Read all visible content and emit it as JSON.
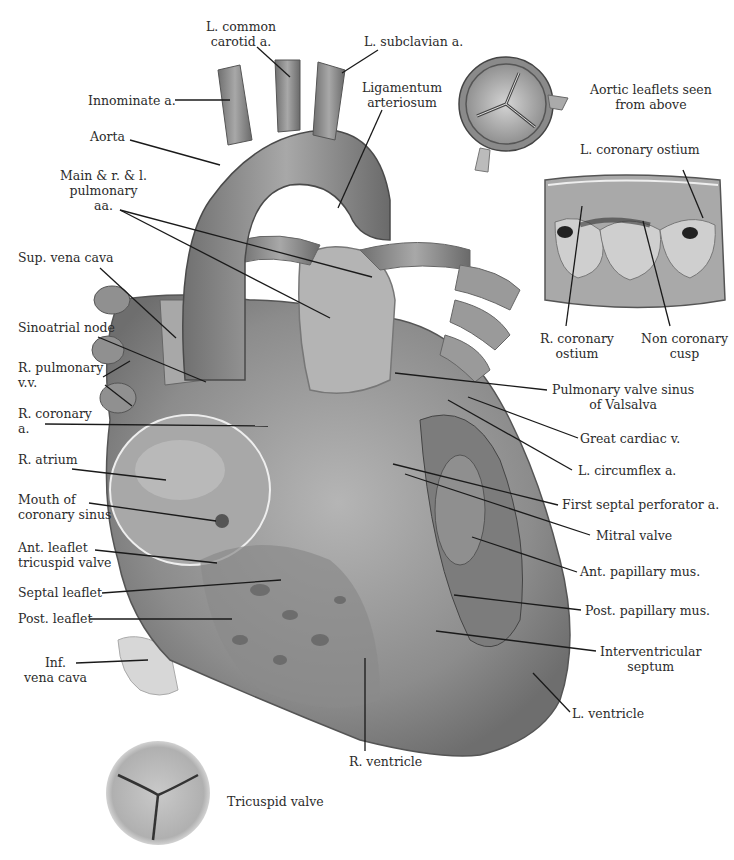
{
  "figure": {
    "insets": {
      "aortic_leaflets": {
        "caption_line1": "Aortic leaflets seen",
        "caption_line2": "from above"
      },
      "aortic_root": {
        "l_coronary_ostium": "L. coronary ostium",
        "r_coronary_ostium_line1": "R. coronary",
        "r_coronary_ostium_line2": "ostium",
        "non_coronary_cusp_line1": "Non coronary",
        "non_coronary_cusp_line2": "cusp"
      },
      "tricuspid": {
        "caption": "Tricuspid valve"
      }
    },
    "labels": {
      "l_common_carotid_1": "L. common",
      "l_common_carotid_2": "carotid a.",
      "l_subclavian": "L. subclavian a.",
      "innominate": "Innominate a.",
      "ligamentum_1": "Ligamentum",
      "ligamentum_2": "arteriosum",
      "aorta": "Aorta",
      "pulm_1": "Main & r. & l.",
      "pulm_2": "pulmonary",
      "pulm_3": "aa.",
      "svc": "Sup. vena cava",
      "sa_node": "Sinoatrial node",
      "r_pulm_vv_1": "R. pulmonary",
      "r_pulm_vv_2": "v.v.",
      "r_coronary_1": "R. coronary",
      "r_coronary_2": "a.",
      "r_atrium": "R. atrium",
      "cor_sinus_1": "Mouth of",
      "cor_sinus_2": "coronary sinus",
      "ant_leaflet_1": "Ant. leaflet",
      "ant_leaflet_2": "tricuspid valve",
      "septal_leaflet": "Septal leaflet",
      "post_leaflet": "Post. leaflet",
      "ivc_1": "Inf.",
      "ivc_2": "vena cava",
      "pulm_sinus_1": "Pulmonary valve sinus",
      "pulm_sinus_2": "of Valsalva",
      "great_cardiac": "Great cardiac v.",
      "l_circumflex": "L. circumflex a.",
      "first_septal": "First septal perforator a.",
      "mitral": "Mitral valve",
      "ant_papillary": "Ant. papillary mus.",
      "post_papillary": "Post. papillary mus.",
      "iv_septum_1": "Interventricular",
      "iv_septum_2": "septum",
      "l_ventricle": "L. ventricle",
      "r_ventricle": "R. ventricle"
    }
  }
}
